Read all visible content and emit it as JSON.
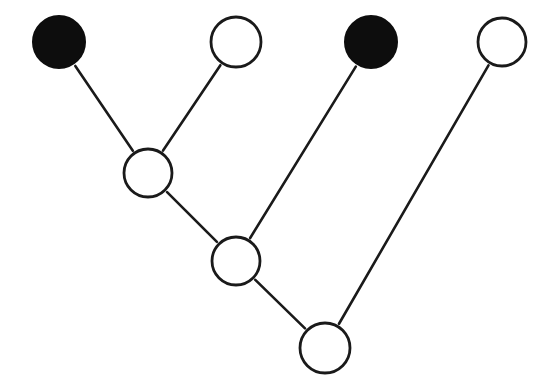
{
  "canvas": {
    "width": 543,
    "height": 388,
    "background_color": "#ffffff"
  },
  "style": {
    "node_stroke_color": "#1a1a1a",
    "node_fill_open": "#ffffff",
    "node_fill_filled": "#0d0d0d",
    "edge_color": "#1a1a1a",
    "edge_width": 2.6,
    "node_stroke_width": 2.8,
    "edge_gap": 3
  },
  "graph": {
    "type": "node-link-diagram",
    "node_count": 7,
    "edge_count": 6,
    "nodes": [
      {
        "id": "n1",
        "label": "leaf-1",
        "cx": 59,
        "cy": 42,
        "r": 26,
        "state": "filled",
        "role": "leaf"
      },
      {
        "id": "n2",
        "label": "leaf-2",
        "cx": 236,
        "cy": 42,
        "r": 25,
        "state": "open",
        "role": "leaf"
      },
      {
        "id": "n3",
        "label": "leaf-3",
        "cx": 371,
        "cy": 42,
        "r": 26,
        "state": "filled",
        "role": "leaf"
      },
      {
        "id": "n4",
        "label": "leaf-4",
        "cx": 502,
        "cy": 42,
        "r": 24,
        "state": "open",
        "role": "leaf"
      },
      {
        "id": "n5",
        "label": "internal-upper",
        "cx": 148,
        "cy": 173,
        "r": 24,
        "state": "open",
        "role": "internal"
      },
      {
        "id": "n6",
        "label": "internal-middle",
        "cx": 236,
        "cy": 261,
        "r": 24,
        "state": "open",
        "role": "internal"
      },
      {
        "id": "n7",
        "label": "internal-lower",
        "cx": 325,
        "cy": 348,
        "r": 25,
        "state": "open",
        "role": "internal"
      }
    ],
    "edges": [
      {
        "id": "e1",
        "label": "leaf-1-to-internal-upper",
        "from": "n1",
        "to": "n5"
      },
      {
        "id": "e2",
        "label": "leaf-2-to-internal-upper",
        "from": "n2",
        "to": "n5"
      },
      {
        "id": "e3",
        "label": "internal-upper-to-middle",
        "from": "n5",
        "to": "n6"
      },
      {
        "id": "e4",
        "label": "leaf-3-to-internal-middle",
        "from": "n3",
        "to": "n6"
      },
      {
        "id": "e5",
        "label": "internal-middle-to-lower",
        "from": "n6",
        "to": "n7"
      },
      {
        "id": "e6",
        "label": "leaf-4-to-internal-lower",
        "from": "n4",
        "to": "n7"
      }
    ]
  }
}
